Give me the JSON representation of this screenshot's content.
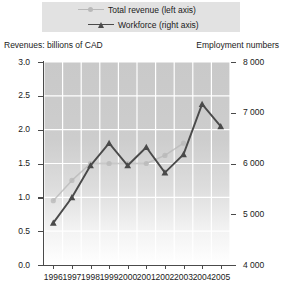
{
  "legend": {
    "position": "top-center",
    "items": [
      {
        "label": "Total revenue (left axis)",
        "marker": "circle-line-icon",
        "color": "#b9b9b9"
      },
      {
        "label": "Workforce (right axis)",
        "marker": "triangle-line-icon",
        "color": "#4a4a4a"
      }
    ]
  },
  "axes": {
    "left_title": "Revenues: billions of CAD",
    "right_title": "Employment numbers",
    "left_ticks": [
      "3.0",
      "2.5",
      "2.0",
      "1.5",
      "1.0",
      "0.5",
      "0.0"
    ],
    "right_ticks": [
      "8 000",
      "7 000",
      "6 000",
      "5 000",
      "4 000"
    ],
    "x_ticks": [
      "1996",
      "1997",
      "1998",
      "1999",
      "2000",
      "2001",
      "2002",
      "2003",
      "2004",
      "2005"
    ]
  },
  "colors": {
    "revenue_line": "#b9b9b9",
    "workforce_line": "#4a4a4a",
    "plot_top": "#c9c9c9",
    "plot_bottom": "#ffffff",
    "gridline": "#ffffff",
    "axis": "#4a4a4a",
    "legend_bg": "#e2e2e2"
  },
  "chart_data": {
    "type": "line",
    "title": "",
    "subtitle": "",
    "xlabel": "",
    "ylabel": "Revenues: billions of CAD",
    "y2label": "Employment numbers",
    "x": [
      "1996",
      "1997",
      "1998",
      "1999",
      "2000",
      "2001",
      "2002",
      "2003",
      "2004",
      "2005"
    ],
    "ylim": [
      0.0,
      3.0
    ],
    "ytick_step": 0.5,
    "y2lim": [
      4000,
      8000
    ],
    "y2tick_step": 1000,
    "grid": true,
    "legend_position": "top-center",
    "series": [
      {
        "name": "Total revenue (left axis)",
        "axis": "left",
        "unit": "billions of CAD",
        "marker": "circle",
        "color": "#b9b9b9",
        "values": [
          0.95,
          1.25,
          1.5,
          1.5,
          1.5,
          1.5,
          1.62,
          1.8,
          null,
          null
        ]
      },
      {
        "name": "Workforce (right axis)",
        "axis": "right",
        "unit": "employees",
        "marker": "triangle",
        "color": "#4a4a4a",
        "values": [
          4830,
          5330,
          5960,
          6400,
          5960,
          6320,
          5820,
          6180,
          7170,
          6730
        ]
      }
    ]
  }
}
